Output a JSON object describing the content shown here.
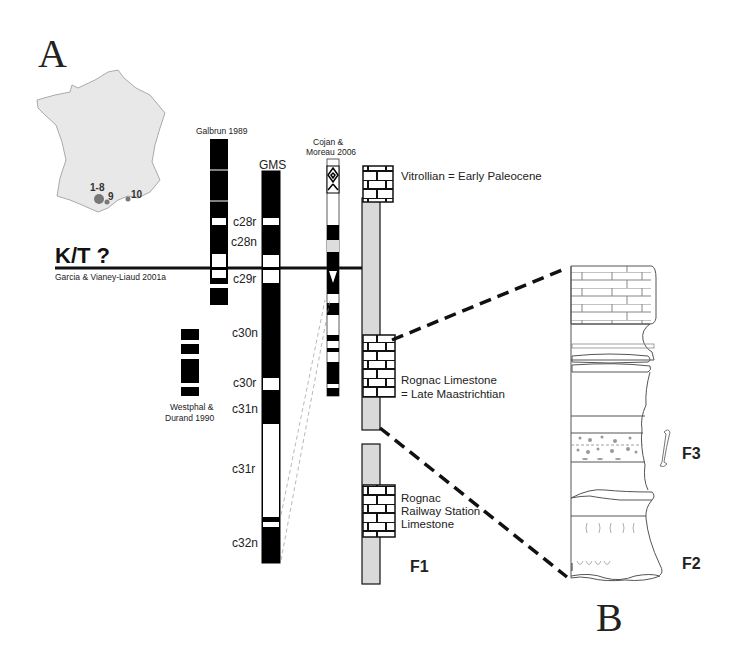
{
  "panels": {
    "a_label": "A",
    "b_label": "B"
  },
  "map": {
    "name": "France locality map",
    "fill": "#e8e8e8",
    "stroke": "#999999",
    "site_color": "#777777",
    "sites": [
      {
        "label": "1-8",
        "size": "large"
      },
      {
        "label": "9",
        "size": "small"
      },
      {
        "label": "10",
        "size": "small"
      }
    ]
  },
  "boundary": {
    "label": "K/T ?",
    "reference": "Garcia & Vianey-Liaud 2001a"
  },
  "columns": {
    "galbrun": {
      "label": "Galbrun 1989"
    },
    "gms": {
      "label": "GMS"
    },
    "cojan": {
      "label_line1": "Cojan &",
      "label_line2": "Moreau 2006"
    },
    "westphal": {
      "label_line1": "Westphal &",
      "label_line2": "Durand 1990"
    }
  },
  "chrons": [
    "c28r",
    "c28n",
    "c29r",
    "c30n",
    "c30r",
    "c31n",
    "c31r",
    "c32n"
  ],
  "units": {
    "vitrollian": "Vitrollian = Early Paleocene",
    "rognac_line1": "Rognac Limestone",
    "rognac_line2": "= Late Maastrichtian",
    "railway_line1": "Rognac",
    "railway_line2": "Railway Station",
    "railway_line3": "Limestone",
    "f1": "F1",
    "f2": "F2",
    "f3": "F3"
  },
  "colors": {
    "normal_polarity": "#000000",
    "reversed_polarity": "#ffffff",
    "section_fill": "#d9d9d9",
    "line": "#111111"
  }
}
